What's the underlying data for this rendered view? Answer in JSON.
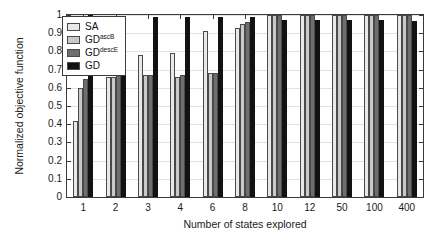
{
  "chart_data": {
    "type": "bar",
    "title": "",
    "xlabel": "Number of states explored",
    "ylabel": "Normalized objective function",
    "categories": [
      "1",
      "2",
      "3",
      "4",
      "6",
      "8",
      "10",
      "12",
      "50",
      "100",
      "400"
    ],
    "ylim": [
      0,
      1
    ],
    "yticks": [
      "0",
      "0.1",
      "0.2",
      "0.3",
      "0.4",
      "0.5",
      "0.6",
      "0.7",
      "0.8",
      "0.9",
      "1"
    ],
    "grid": true,
    "legend_position": "upper-left",
    "series": [
      {
        "name": "SA",
        "name_base": "SA",
        "name_sup": "",
        "color": "#e9e9e9",
        "values": [
          0.42,
          0.66,
          0.78,
          0.79,
          0.91,
          0.93,
          1.0,
          1.0,
          1.0,
          1.0,
          1.0
        ]
      },
      {
        "name": "GD ascB",
        "name_base": "GD",
        "name_sup": "ascB",
        "color": "#c9c9c9",
        "values": [
          0.6,
          0.66,
          0.67,
          0.66,
          0.68,
          0.95,
          1.0,
          1.0,
          1.0,
          1.0,
          1.0
        ]
      },
      {
        "name": "GD descE",
        "name_base": "GD",
        "name_sup": "descE",
        "color": "#6e6e6e",
        "values": [
          0.65,
          0.67,
          0.67,
          0.67,
          0.68,
          0.96,
          1.0,
          1.0,
          1.0,
          1.0,
          1.0
        ]
      },
      {
        "name": "GD",
        "name_base": "GD",
        "name_sup": "",
        "color": "#121212",
        "values": [
          1.0,
          0.99,
          0.99,
          0.99,
          0.99,
          0.99,
          0.975,
          0.975,
          0.975,
          0.975,
          0.965
        ]
      }
    ]
  }
}
